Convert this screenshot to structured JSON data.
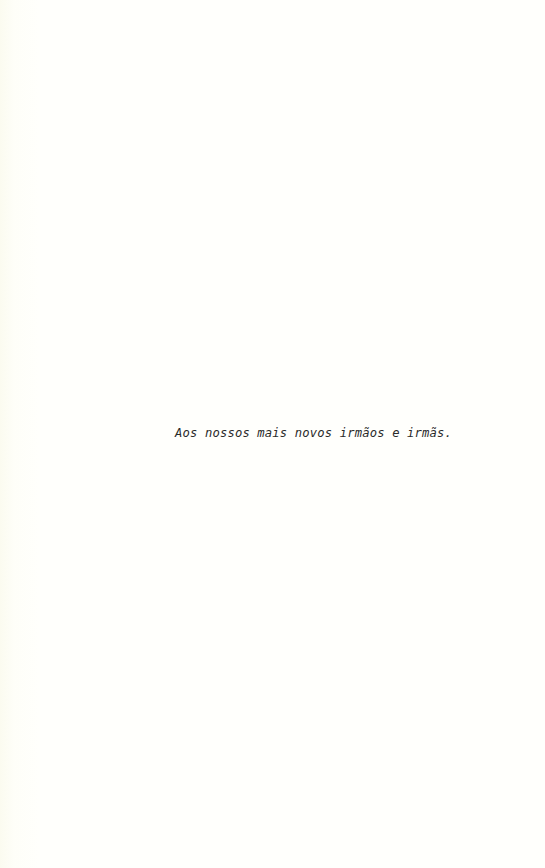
{
  "page": {
    "background_color": "#fffffb",
    "text_color": "#2a2a2a",
    "dedication": "Aos nossos mais novos irmãos e irmãs."
  }
}
